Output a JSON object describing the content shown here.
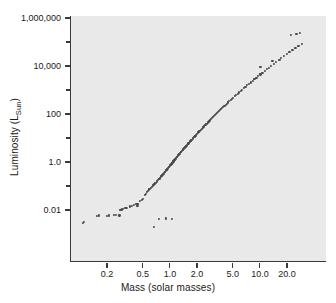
{
  "figure": {
    "title": "",
    "background_color": "#ffffff",
    "plot_background_color": "#e9e9e9",
    "point_color": "#4a4a4a",
    "axis_color": "#3a3a3a"
  },
  "axes": {
    "ylabel_text": "Luminosity (L",
    "ylabel_sub": "Sun",
    "ylabel_close": ")",
    "xlabel": "Mass (solar masses)"
  },
  "chart_data": {
    "type": "scatter",
    "title": "",
    "xlabel": "Mass (solar masses)",
    "ylabel": "Luminosity (L_Sun)",
    "xscale": "log",
    "yscale": "log",
    "xlim": [
      0.1,
      32
    ],
    "ylim": [
      0.0012,
      1200000
    ],
    "grid": false,
    "legend": "none",
    "xticks": [
      0.2,
      0.5,
      1.0,
      2.0,
      5.0,
      10.0,
      20.0
    ],
    "xticklabels": [
      "0.2",
      "0.5",
      "1.0",
      "2.0",
      "5.0",
      "10.0",
      "20.0"
    ],
    "yticks": [
      0.01,
      1.0,
      100,
      10000,
      1000000
    ],
    "yticklabels": [
      "0.01",
      "1.0",
      "100",
      "10,000",
      "1,000,000"
    ],
    "yminorticks": [
      0.1,
      10,
      1000,
      100000
    ],
    "relation": "L proportional to M^3.5 (main-sequence mass-luminosity relation)",
    "x": [
      0.106,
      0.108,
      0.152,
      0.158,
      0.195,
      0.205,
      0.232,
      0.243,
      0.275,
      0.285,
      0.292,
      0.312,
      0.325,
      0.352,
      0.368,
      0.385,
      0.412,
      0.425,
      0.432,
      0.452,
      0.475,
      0.488,
      0.512,
      0.525,
      0.545,
      0.558,
      0.572,
      0.585,
      0.598,
      0.612,
      0.625,
      0.638,
      0.652,
      0.665,
      0.678,
      0.692,
      0.705,
      0.718,
      0.732,
      0.745,
      0.758,
      0.772,
      0.785,
      0.798,
      0.812,
      0.825,
      0.838,
      0.852,
      0.865,
      0.878,
      0.892,
      0.905,
      0.918,
      0.932,
      0.945,
      0.958,
      0.972,
      0.985,
      0.998,
      1.012,
      1.025,
      1.038,
      1.052,
      1.065,
      1.082,
      1.095,
      1.112,
      1.125,
      1.142,
      1.158,
      1.175,
      1.192,
      1.208,
      1.225,
      1.245,
      1.262,
      1.285,
      1.305,
      1.325,
      1.348,
      1.368,
      1.392,
      1.415,
      1.438,
      1.462,
      1.488,
      1.512,
      1.538,
      1.565,
      1.592,
      1.618,
      1.648,
      1.678,
      1.708,
      1.738,
      1.772,
      1.805,
      1.838,
      1.875,
      1.912,
      1.948,
      1.988,
      2.025,
      2.068,
      2.108,
      2.152,
      2.198,
      2.245,
      2.292,
      2.342,
      2.392,
      2.445,
      2.498,
      2.555,
      2.612,
      2.672,
      2.735,
      2.798,
      2.865,
      2.935,
      3.005,
      3.082,
      3.158,
      3.238,
      3.325,
      3.412,
      3.505,
      3.602,
      3.705,
      3.812,
      3.925,
      4.045,
      4.172,
      4.305,
      4.448,
      4.598,
      4.758,
      4.928,
      5.108,
      5.298,
      5.502,
      5.718,
      5.948,
      6.195,
      6.458,
      6.738,
      7.038,
      7.358,
      7.702,
      8.072,
      8.468,
      8.895,
      9.355,
      9.852,
      10.39,
      10.97,
      11.6,
      12.29,
      13.04,
      13.86,
      14.75,
      15.73,
      16.81,
      18.0,
      19.31,
      20.76,
      22.37,
      24.16,
      26.16,
      28.4,
      0.645,
      0.742,
      0.885,
      1.025,
      0.268,
      0.425,
      9.88,
      13.45,
      16.25,
      21.4,
      24.8,
      27.2
    ],
    "y": [
      0.003,
      0.0031,
      0.0058,
      0.006,
      0.0058,
      0.006,
      0.0062,
      0.0063,
      0.0098,
      0.0105,
      0.011,
      0.0118,
      0.0125,
      0.0142,
      0.015,
      0.0158,
      0.0175,
      0.0182,
      0.0185,
      0.0238,
      0.0272,
      0.029,
      0.0415,
      0.0465,
      0.058,
      0.064,
      0.072,
      0.0785,
      0.085,
      0.0925,
      0.1,
      0.108,
      0.118,
      0.128,
      0.138,
      0.15,
      0.162,
      0.175,
      0.19,
      0.205,
      0.222,
      0.24,
      0.258,
      0.278,
      0.3,
      0.322,
      0.346,
      0.372,
      0.4,
      0.428,
      0.46,
      0.492,
      0.526,
      0.564,
      0.602,
      0.642,
      0.686,
      0.73,
      0.778,
      0.828,
      0.88,
      0.935,
      0.993,
      1.052,
      1.13,
      1.198,
      1.29,
      1.365,
      1.468,
      1.568,
      1.68,
      1.8,
      1.918,
      2.045,
      2.205,
      2.348,
      2.548,
      2.728,
      2.92,
      3.15,
      3.36,
      3.62,
      3.885,
      4.165,
      4.465,
      4.8,
      5.145,
      5.51,
      5.92,
      6.345,
      6.79,
      7.33,
      7.9,
      8.5,
      9.14,
      9.91,
      10.7,
      11.55,
      12.55,
      13.62,
      14.75,
      16.05,
      17.4,
      18.95,
      20.5,
      22.3,
      24.25,
      26.35,
      28.6,
      31.1,
      33.8,
      36.85,
      40.1,
      43.8,
      47.8,
      52.2,
      57.0,
      62.2,
      68.0,
      74.5,
      81.5,
      89.5,
      98.0,
      108.0,
      119.5,
      131.5,
      145.0,
      160.5,
      177.0,
      196.5,
      218.0,
      243.0,
      271.0,
      303.0,
      340.0,
      382.0,
      430.0,
      485.0,
      548.0,
      620.0,
      705.0,
      800.0,
      910.0,
      1040.0,
      1190.0,
      1365.0,
      1570.0,
      1810.0,
      2090.0,
      2420.0,
      2810.0,
      3270.0,
      3820.0,
      4470.0,
      5250.0,
      6180.0,
      7300.0,
      8650.0,
      10300.0,
      12300.0,
      14700.0,
      17600.0,
      21200.0,
      25600.0,
      31000.0,
      37800.0,
      46200.0,
      56500.0,
      69500.0,
      85500.0,
      0.00195,
      0.0042,
      0.0045,
      0.0042,
      0.006,
      0.015,
      9500.0,
      16500.0,
      18500.0,
      195000.0,
      225000.0,
      240000.0
    ],
    "n_points": 174
  }
}
